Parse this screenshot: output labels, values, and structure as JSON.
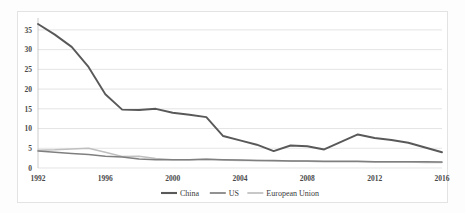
{
  "chart_data": {
    "type": "line",
    "title": "",
    "subtitle": "",
    "xlabel": "",
    "ylabel": "",
    "xlim": [
      1992,
      2016
    ],
    "ylim": [
      0,
      37
    ],
    "grid": true,
    "legend_position": "bottom",
    "x": [
      1992,
      1993,
      1994,
      1995,
      1996,
      1997,
      1998,
      1999,
      2000,
      2001,
      2002,
      2003,
      2004,
      2005,
      2006,
      2007,
      2008,
      2009,
      2010,
      2011,
      2012,
      2013,
      2014,
      2015,
      2016
    ],
    "xticks": [
      "1992",
      "1996",
      "2000",
      "2004",
      "2008",
      "2012",
      "2016"
    ],
    "xtick_values": [
      1992,
      1996,
      2000,
      2004,
      2008,
      2012,
      2016
    ],
    "yticks": [
      "0",
      "5",
      "10",
      "15",
      "20",
      "25",
      "30",
      "35"
    ],
    "ytick_values": [
      0,
      5,
      10,
      15,
      20,
      25,
      30,
      35
    ],
    "series": [
      {
        "name": "China",
        "color": "#595959",
        "width": 1.9,
        "values": [
          36.5,
          33.8,
          30.7,
          25.6,
          18.7,
          14.8,
          14.7,
          15.0,
          14.0,
          13.5,
          12.9,
          8.1,
          7.0,
          5.9,
          4.3,
          5.7,
          5.5,
          4.7,
          6.6,
          8.5,
          7.6,
          7.1,
          6.4,
          5.2,
          4.0
        ]
      },
      {
        "name": "US",
        "color": "#7f7f7f",
        "width": 1.5,
        "values": [
          4.3,
          4.0,
          3.7,
          3.4,
          3.0,
          2.8,
          2.3,
          2.1,
          2.1,
          2.1,
          2.2,
          2.1,
          2.0,
          1.9,
          1.9,
          1.8,
          1.8,
          1.7,
          1.7,
          1.7,
          1.6,
          1.6,
          1.6,
          1.6,
          1.5
        ]
      },
      {
        "name": "European Union",
        "color": "#bfbfbf",
        "width": 1.5,
        "values": [
          4.5,
          4.6,
          4.8,
          5.0,
          4.0,
          2.9,
          3.0,
          2.4,
          2.1,
          2.1,
          2.2,
          2.0,
          1.9,
          1.9,
          1.8,
          1.8,
          1.7,
          1.6,
          1.6,
          1.6,
          1.5,
          1.5,
          1.5,
          1.4,
          1.4
        ]
      }
    ]
  },
  "legend": {
    "items": [
      {
        "label": "China",
        "color": "#595959"
      },
      {
        "label": "US",
        "color": "#7f7f7f"
      },
      {
        "label": "European Union",
        "color": "#bfbfbf"
      }
    ]
  }
}
